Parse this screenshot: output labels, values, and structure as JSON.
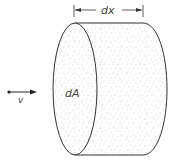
{
  "diagram": {
    "labels": {
      "length": "dx",
      "area": "dA",
      "velocity": "v"
    },
    "colors": {
      "stroke": "#333333",
      "speckle": "#9a9a9a",
      "fill": "#ffffff"
    }
  }
}
